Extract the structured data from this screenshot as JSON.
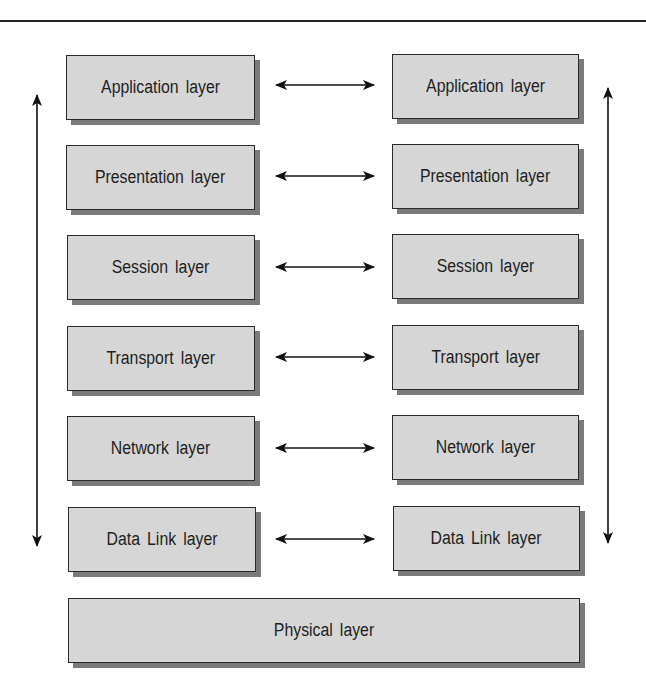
{
  "diagram": {
    "title": "",
    "left_stack": [
      {
        "label": "Application layer"
      },
      {
        "label": "Presentation layer"
      },
      {
        "label": "Session layer"
      },
      {
        "label": "Transport layer"
      },
      {
        "label": "Network layer"
      },
      {
        "label": "Data Link layer"
      }
    ],
    "right_stack": [
      {
        "label": "Application layer"
      },
      {
        "label": "Presentation layer"
      },
      {
        "label": "Session layer"
      },
      {
        "label": "Transport layer"
      },
      {
        "label": "Network layer"
      },
      {
        "label": "Data Link layer"
      }
    ],
    "shared": {
      "label": "Physical layer"
    },
    "edges": [
      {
        "from": "left.Application layer",
        "to": "right.Application layer",
        "type": "bidirectional"
      },
      {
        "from": "left.Presentation layer",
        "to": "right.Presentation layer",
        "type": "bidirectional"
      },
      {
        "from": "left.Session layer",
        "to": "right.Session layer",
        "type": "bidirectional"
      },
      {
        "from": "left.Transport layer",
        "to": "right.Transport layer",
        "type": "bidirectional"
      },
      {
        "from": "left.Network layer",
        "to": "right.Network layer",
        "type": "bidirectional"
      },
      {
        "from": "left.Data Link layer",
        "to": "right.Data Link layer",
        "type": "bidirectional"
      },
      {
        "from": "left.top",
        "to": "left.bottom",
        "type": "bidirectional-vertical"
      },
      {
        "from": "right.top",
        "to": "right.bottom",
        "type": "bidirectional-vertical"
      }
    ],
    "colors": {
      "box_fill": "#d6d6d6",
      "box_border": "#2a2a2a",
      "shadow": "#7a7a7a",
      "line": "#111111"
    }
  }
}
